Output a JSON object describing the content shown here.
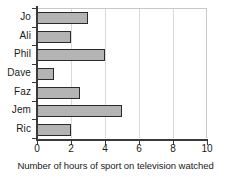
{
  "chart_data": {
    "type": "bar",
    "orientation": "horizontal",
    "title": "",
    "xlabel": "Number of hours of sport on television watched",
    "ylabel": "",
    "categories": [
      "Jo",
      "Ali",
      "Phil",
      "Dave",
      "Faz",
      "Jem",
      "Ric"
    ],
    "values": [
      3,
      2,
      4,
      1,
      2.5,
      5,
      2
    ],
    "xlim": [
      0,
      10
    ],
    "xticks": [
      0,
      2,
      4,
      6,
      8,
      10
    ],
    "xticklabels": [
      "0",
      "2",
      "4",
      "6",
      "8",
      "10"
    ],
    "grid": "vertical",
    "legend": "none",
    "bar_color": "#b4b4b4",
    "bar_edge_color": "#2b2b2b",
    "axis_color": "#3a3a3a",
    "gridline_color": "#d9d9d9"
  }
}
